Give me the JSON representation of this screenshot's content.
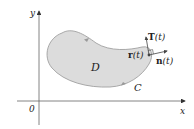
{
  "figure": {
    "axes": {
      "x_label": "x",
      "y_label": "y",
      "origin_label": "0",
      "color": "#555555"
    },
    "region": {
      "label": "D",
      "fill": "#dcdcdc",
      "stroke": "#9a9a9a"
    },
    "curve": {
      "label": "C",
      "orientation": "counterclockwise"
    },
    "vectors": {
      "position": {
        "bold": "r",
        "arg": "(t)"
      },
      "tangent": {
        "bold": "T",
        "arg": "(t)"
      },
      "normal": {
        "bold": "n",
        "arg": "(t)"
      },
      "color": "#444444"
    }
  }
}
